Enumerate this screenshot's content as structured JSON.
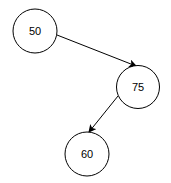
{
  "diagram": {
    "type": "binary-search-tree",
    "nodes": [
      {
        "id": "n50",
        "label": "50",
        "cx": 35,
        "cy": 31,
        "r": 22
      },
      {
        "id": "n75",
        "label": "75",
        "cx": 138,
        "cy": 87,
        "r": 21.5
      },
      {
        "id": "n60",
        "label": "60",
        "cx": 87,
        "cy": 154,
        "r": 22
      }
    ],
    "edges": [
      {
        "from": "50",
        "to": "75",
        "direction": "right-child"
      },
      {
        "from": "75",
        "to": "60",
        "direction": "left-child"
      }
    ],
    "colors": {
      "stroke": "#000000",
      "fill": "#ffffff",
      "text": "#000000"
    }
  }
}
